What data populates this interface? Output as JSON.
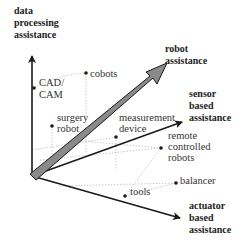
{
  "axes": {
    "vertical": {
      "line1": "data",
      "line2": "processing",
      "line3": "assistance"
    },
    "robot": {
      "line1": "robot",
      "line2": "assistance"
    },
    "sensor": {
      "line1": "sensor",
      "line2": "based",
      "line3": "assistance"
    },
    "actuator": {
      "line1": "actuator",
      "line2": "based",
      "line3": "assistance"
    }
  },
  "points": {
    "cad_cam": {
      "line1": "CAD/",
      "line2": "CAM"
    },
    "cobots": {
      "line1": "cobots"
    },
    "surgery_robot": {
      "line1": "surgery",
      "line2": "robot"
    },
    "measurement_device": {
      "line1": "measurement",
      "line2": "device"
    },
    "remote_controlled_robots": {
      "line1": "remote",
      "line2": "controlled",
      "line3": "robots"
    },
    "balancer": {
      "line1": "balancer"
    },
    "tools": {
      "line1": "tools"
    }
  },
  "colors": {
    "axis": "#1a1a1a",
    "robot_arrow_fill": "#8a8a8a",
    "guide": "#bdbdbd"
  }
}
